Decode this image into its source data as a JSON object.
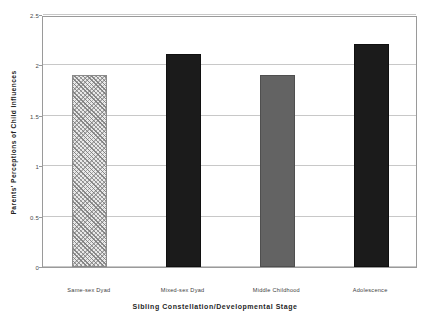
{
  "chart_data": {
    "type": "bar",
    "title": "",
    "xlabel": "Sibling Constellation/Developmental Stage",
    "ylabel": "Parents' Perceptions of Child Influences",
    "categories": [
      "Same-sex Dyad",
      "Mixed-sex Dyad",
      "Middle Childhood",
      "Adolescence"
    ],
    "values": [
      1.9,
      2.11,
      1.9,
      2.21
    ],
    "ylim": [
      0,
      2.5
    ],
    "yticks": [
      "0",
      "0.5",
      "1",
      "1.5",
      "2",
      "2.5"
    ],
    "ytick_values": [
      0,
      0.5,
      1,
      1.5,
      2,
      2.5
    ],
    "grid": true,
    "legend": "none",
    "bar_styles": [
      "hatch",
      "dark",
      "gray",
      "dark"
    ],
    "colors": {
      "bar_hatch_fill": "#e9e9e9",
      "bar_dark_fill": "#1b1b1b",
      "bar_gray_fill": "#636363",
      "gridline": "#c8c8c8",
      "frame": "#9a9a9a",
      "text": "#1f1f1f"
    }
  }
}
